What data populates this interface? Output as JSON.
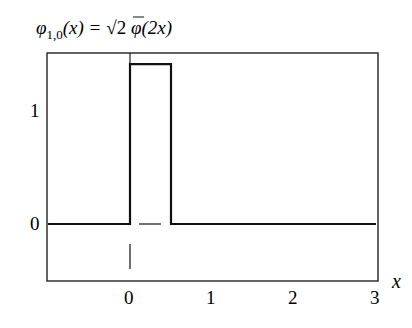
{
  "chart_data": {
    "type": "line",
    "title": "φ1,0(x) = √2 φ(2x)",
    "title_parts": {
      "phi": "φ",
      "subscript": "1,0",
      "lhs_arg": "(x) = ",
      "sqrt": "√",
      "sqrt_arg": "2",
      "rhs": " φ(2x)"
    },
    "xlabel": "x",
    "ylabel": "",
    "xlim": [
      -1,
      3
    ],
    "ylim": [
      -0.5,
      1.5
    ],
    "x_ticks": [
      0,
      1,
      2,
      3
    ],
    "x_tick_labels": [
      "0",
      "1",
      "2",
      "3"
    ],
    "y_ticks": [
      0,
      1
    ],
    "y_tick_labels": [
      "0",
      "1"
    ],
    "grid": false,
    "legend": null,
    "series": [
      {
        "name": "φ1,0(x)",
        "x": [
          -1,
          0,
          0,
          0.5,
          0.5,
          3
        ],
        "y": [
          0,
          0,
          1.414,
          1.414,
          0,
          0
        ]
      }
    ],
    "annotations": [
      {
        "type": "dash",
        "x_from": 0.1,
        "x_to": 0.38,
        "y": 0
      },
      {
        "type": "vertical-tick",
        "x": 0,
        "y_from": -0.18,
        "y_to": -0.4
      }
    ]
  }
}
